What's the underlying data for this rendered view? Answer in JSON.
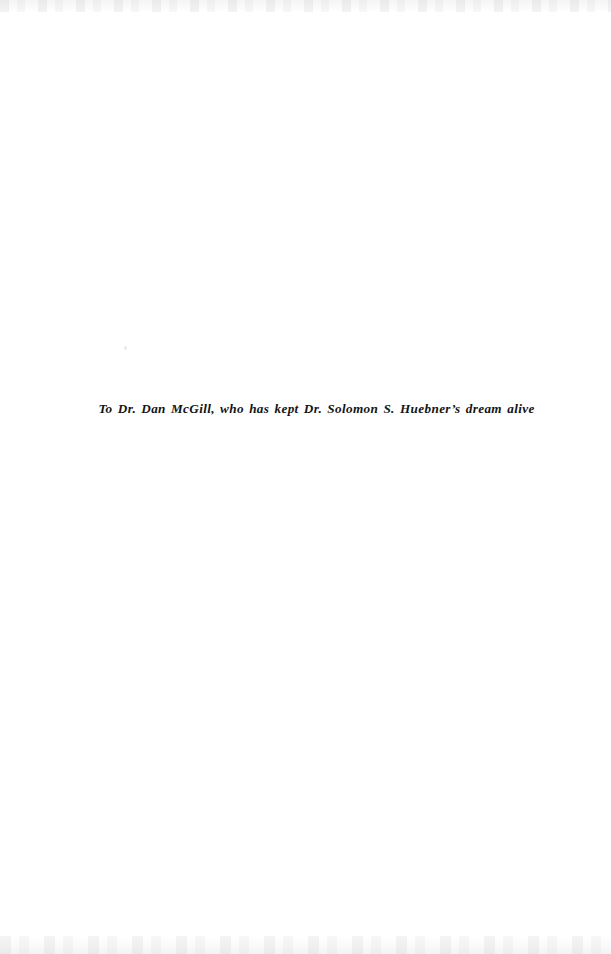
{
  "document": {
    "page_type": "dedication",
    "dedication": {
      "text": "To Dr. Dan McGill, who has kept Dr. Solomon S. Huebner’s dream alive"
    }
  },
  "colors": {
    "page_background": "#ffffff",
    "text": "#141414",
    "scan_artifact": "#8c8c94"
  }
}
